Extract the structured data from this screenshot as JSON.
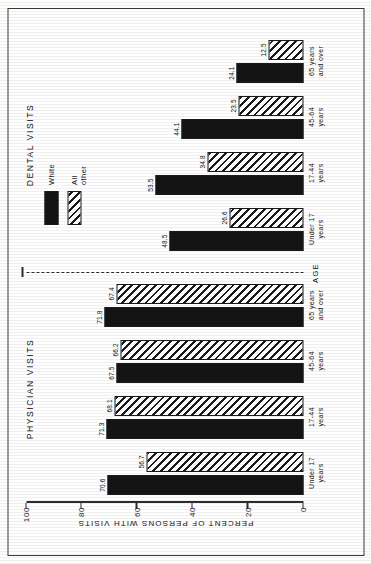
{
  "axis": {
    "y_title": "PERCENT OF PERSONS WITH VISITS",
    "x_title": "AGE",
    "ticks": [
      "0",
      "20",
      "40",
      "60",
      "80",
      "100"
    ],
    "tick_values": [
      0,
      20,
      40,
      60,
      80,
      100
    ],
    "ymin": 0,
    "ymax": 100
  },
  "legend": {
    "items": [
      {
        "label": "White",
        "pattern": "solid-black"
      },
      {
        "label": "All other",
        "pattern": "diagonal-hatch"
      }
    ]
  },
  "panels": [
    {
      "title": "PHYSICIAN VISITS"
    },
    {
      "title": "DENTAL VISITS"
    }
  ],
  "groups": {
    "physician": [
      {
        "label_line1": "Under 17",
        "label_line2": "years",
        "white": "70.6",
        "other": "56.7"
      },
      {
        "label_line1": "17-44",
        "label_line2": "years",
        "white": "71.3",
        "other": "68.1"
      },
      {
        "label_line1": "45-64",
        "label_line2": "years",
        "white": "67.5",
        "other": "66.2"
      },
      {
        "label_line1": "65 years",
        "label_line2": "and over",
        "white": "71.8",
        "other": "67.4"
      }
    ],
    "dental": [
      {
        "label_line1": "Under 17",
        "label_line2": "years",
        "white": "48.5",
        "other": "26.6"
      },
      {
        "label_line1": "17-44",
        "label_line2": "years",
        "white": "53.5",
        "other": "34.8"
      },
      {
        "label_line1": "45-64",
        "label_line2": "years",
        "white": "44.1",
        "other": "23.5"
      },
      {
        "label_line1": "65 years",
        "label_line2": "and over",
        "white": "24.1",
        "other": "12.5"
      }
    ]
  },
  "chart_data": {
    "type": "bar",
    "title": "",
    "xlabel": "AGE",
    "ylabel": "PERCENT OF PERSONS WITH VISITS",
    "ylim": [
      0,
      100
    ],
    "yticks": [
      0,
      20,
      40,
      60,
      80,
      100
    ],
    "grid": false,
    "legend_position": "top-right",
    "panels": [
      {
        "panel_title": "PHYSICIAN VISITS",
        "categories": [
          "Under 17 years",
          "17-44 years",
          "45-64 years",
          "65 years and over"
        ],
        "series": [
          {
            "name": "White",
            "values": [
              70.6,
              71.3,
              67.5,
              71.8
            ]
          },
          {
            "name": "All other",
            "values": [
              56.7,
              68.1,
              66.2,
              67.4
            ]
          }
        ]
      },
      {
        "panel_title": "DENTAL VISITS",
        "categories": [
          "Under 17 years",
          "17-44 years",
          "45-64 years",
          "65 years and over"
        ],
        "series": [
          {
            "name": "White",
            "values": [
              48.5,
              53.5,
              44.1,
              24.1
            ]
          },
          {
            "name": "All other",
            "values": [
              26.6,
              34.8,
              23.5,
              12.5
            ]
          }
        ]
      }
    ]
  }
}
